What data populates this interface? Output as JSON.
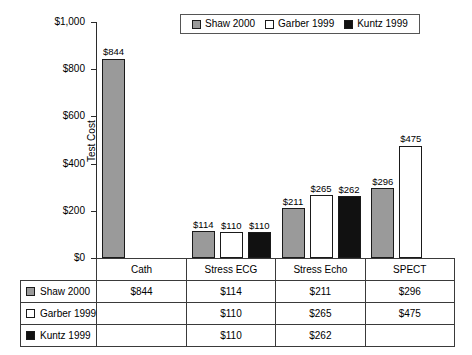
{
  "chart_data": {
    "type": "bar",
    "title": "",
    "xlabel": "",
    "ylabel": "Test Cost",
    "ylim": [
      0,
      1000
    ],
    "ytick_labels": [
      "$1,000",
      "$800",
      "$600",
      "$400",
      "$200",
      "$0"
    ],
    "ytick_values": [
      1000,
      800,
      600,
      400,
      200,
      0
    ],
    "grid": false,
    "legend_position": "top",
    "categories": [
      "Cath",
      "Stress ECG",
      "Stress Echo",
      "SPECT"
    ],
    "series": [
      {
        "name": "Shaw 2000",
        "color": "#9a9a9a",
        "values": [
          844,
          114,
          211,
          296
        ],
        "labels": [
          "$844",
          "$114",
          "$211",
          "$296"
        ]
      },
      {
        "name": "Garber 1999",
        "color": "#ffffff",
        "values": [
          null,
          110,
          265,
          475
        ],
        "labels": [
          "",
          "$110",
          "$265",
          "$475"
        ]
      },
      {
        "name": "Kuntz 1999",
        "color": "#111111",
        "values": [
          null,
          110,
          262,
          null
        ],
        "labels": [
          "",
          "$110",
          "$262",
          ""
        ]
      }
    ]
  },
  "legend": {
    "entries": [
      {
        "label": "Shaw 2000",
        "swatch": "gray"
      },
      {
        "label": "Garber 1999",
        "swatch": "white"
      },
      {
        "label": "Kuntz 1999",
        "swatch": "black"
      }
    ]
  },
  "table": {
    "corner": "",
    "column_headers": [
      "Cath",
      "Stress ECG",
      "Stress Echo",
      "SPECT"
    ],
    "rows": [
      {
        "label": "Shaw 2000",
        "swatch": "gray",
        "cells": [
          "$844",
          "$114",
          "$211",
          "$296"
        ]
      },
      {
        "label": "Garber 1999",
        "swatch": "white",
        "cells": [
          "",
          "$110",
          "$265",
          "$475"
        ]
      },
      {
        "label": "Kuntz 1999",
        "swatch": "black",
        "cells": [
          "",
          "$110",
          "$262",
          ""
        ]
      }
    ]
  },
  "colors": {
    "series_shaw": "#9a9a9a",
    "series_garber": "#ffffff",
    "series_kuntz": "#111111",
    "axis": "#2b2b2b",
    "border": "#3a3a3a"
  }
}
